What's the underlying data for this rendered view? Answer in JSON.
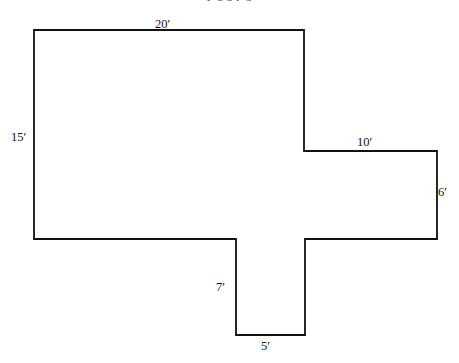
{
  "page": {
    "clipped_heading_text": "y g g p g",
    "background_color": "#ffffff",
    "stroke_color": "#111111",
    "fill_color": "#ffffff",
    "stroke_width": 1.8,
    "width": 459,
    "height": 363
  },
  "figure": {
    "name": "rectilinear-floor-plan-polygon",
    "unit_symbol": "'",
    "unit_name": "feet",
    "path_d": "M 34 30 L 304 30 L 304 151 L 437 151 L 437 239 L 305 239 L 305 335 L 236 335 L 236 239 L 34 239 Z",
    "vertices": [
      {
        "x": 34,
        "y": 30
      },
      {
        "x": 304,
        "y": 30
      },
      {
        "x": 304,
        "y": 151
      },
      {
        "x": 437,
        "y": 151
      },
      {
        "x": 437,
        "y": 239
      },
      {
        "x": 305,
        "y": 239
      },
      {
        "x": 305,
        "y": 335
      },
      {
        "x": 236,
        "y": 335
      },
      {
        "x": 236,
        "y": 239
      },
      {
        "x": 34,
        "y": 239
      }
    ],
    "labels": [
      {
        "id": "top20",
        "text": "20′",
        "value": 20,
        "edge": "top",
        "position": "above"
      },
      {
        "id": "left15",
        "text": "15′",
        "value": 15,
        "edge": "left",
        "position": "left"
      },
      {
        "id": "right10",
        "text": "10′",
        "value": 10,
        "edge": "right-wing-top",
        "position": "above"
      },
      {
        "id": "right6",
        "text": "6′",
        "value": 6,
        "edge": "right-wing-right",
        "position": "right"
      },
      {
        "id": "mid7",
        "text": "7′",
        "value": 7,
        "edge": "bottom-tab-left",
        "position": "left"
      },
      {
        "id": "bot5",
        "text": "5′",
        "value": 5,
        "edge": "bottom-tab-bottom",
        "position": "below"
      }
    ]
  }
}
